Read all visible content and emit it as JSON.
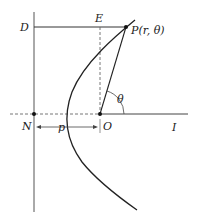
{
  "diagram": {
    "labels": {
      "D": "D",
      "E": "E",
      "P": "P(r, θ)",
      "theta": "θ",
      "N": "N",
      "O": "O",
      "I": "I",
      "p": "p"
    },
    "colors": {
      "stroke": "#222222",
      "axis": "#555555",
      "dashed": "#666666"
    },
    "points": {
      "P": [
        126,
        27
      ],
      "O": [
        100,
        114
      ],
      "N": [
        34,
        114
      ],
      "E": [
        100,
        27
      ],
      "D": [
        34,
        27
      ]
    }
  }
}
